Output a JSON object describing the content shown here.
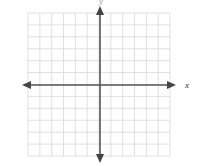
{
  "figure": {
    "title": "",
    "width": 208,
    "height": 166,
    "background_color": "#ffffff"
  },
  "chart_data": {
    "type": "scatter",
    "title": "",
    "subtitle": "",
    "xlabel": "x",
    "ylabel": "y",
    "xlim": [
      -6,
      6
    ],
    "ylim": [
      -6,
      6
    ],
    "xticks": [
      -6,
      -5,
      -4,
      -3,
      -2,
      -1,
      0,
      1,
      2,
      3,
      4,
      5,
      6
    ],
    "yticks": [
      -6,
      -5,
      -4,
      -3,
      -2,
      -1,
      0,
      1,
      2,
      3,
      4,
      5,
      6
    ],
    "xticklabels": [],
    "yticklabels": [],
    "grid": true,
    "grid_columns": 12,
    "grid_rows": 12,
    "legend": null,
    "legend_position": "none",
    "series": [],
    "annotations": [],
    "x": [],
    "y": []
  },
  "axes": {
    "x_axis_label": "x",
    "y_axis_label": "y",
    "origin_x": 100,
    "origin_y": 85,
    "axis_color": "#555555",
    "grid_color": "#dcdcdc",
    "grid_minor_color": "#eeeeee",
    "x_label_color": "#2b2b2b",
    "y_label_color": "#9a9a9a",
    "arrowheads": [
      "left",
      "right",
      "up",
      "down"
    ]
  },
  "grid_geometry": {
    "left": 28,
    "right": 170,
    "top": 13,
    "bottom": 156,
    "cell_size": 11.85,
    "columns": 12,
    "rows": 12
  },
  "arrows": {
    "x_left_tip": 22,
    "x_right_tip": 176,
    "y_top_tip": 6,
    "y_bottom_tip": 163
  }
}
